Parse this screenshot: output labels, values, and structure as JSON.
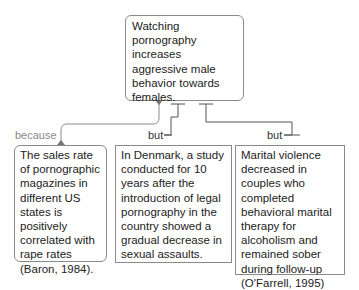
{
  "claim": {
    "text": "Watching pornography increases aggressive male behavior towards females."
  },
  "premises": [
    {
      "relation": "because",
      "text": "The sales rate of pornographic magazines in different US states is positively correlated with rape rates (Baron, 1984)."
    },
    {
      "relation": "but",
      "text": "In Denmark, a study conducted for 10 years after the introduction of legal pornography in the country showed a gradual decrease in sexual assaults."
    },
    {
      "relation": "but",
      "text": "Marital violence decreased in couples who completed behavioral marital therapy for alcoholism and remained sober during follow-up (O'Farrell, 1995)"
    }
  ],
  "colors": {
    "border": "#8a8a8a",
    "because_label": "#8a8a8a",
    "but_label": "#333333"
  }
}
